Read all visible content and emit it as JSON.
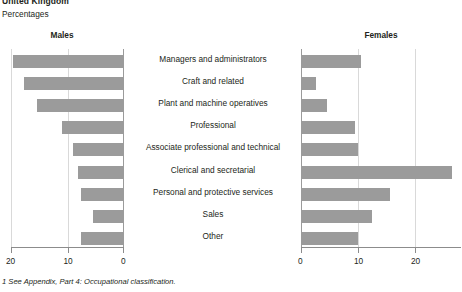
{
  "header": {
    "region_title": "United Kingdom",
    "subtitle": "Percentages"
  },
  "panels": {
    "males_heading": "Males",
    "females_heading": "Females"
  },
  "footnote": "1 See Appendix, Part 4: Occupational classification.",
  "colors": {
    "bar": "#9b9b9b",
    "axis": "#8c8c8c",
    "grid": "#d9d9d9",
    "text": "#231f20"
  },
  "chart_data": {
    "type": "bar",
    "title": "United Kingdom",
    "subtitle": "Percentages",
    "orientation": "horizontal",
    "layout": "butterfly-pyramid",
    "grid": true,
    "legend": "none",
    "xlabel": "",
    "ylabel": "",
    "categories": [
      "Managers and administrators",
      "Craft and related",
      "Plant and machine operatives",
      "Professional",
      "Associate professional and technical",
      "Clerical and secretarial",
      "Personal and protective services",
      "Sales",
      "Other"
    ],
    "series": [
      {
        "name": "Males",
        "side": "left",
        "axis_direction": "reversed",
        "xlim": [
          0,
          20
        ],
        "ticks": [
          20,
          10,
          0
        ],
        "tick_labels": [
          "20",
          "10",
          "0"
        ],
        "values": [
          19.6,
          17.7,
          15.4,
          11.0,
          9.0,
          8.2,
          7.6,
          5.5,
          7.6
        ]
      },
      {
        "name": "Females",
        "side": "right",
        "axis_direction": "normal",
        "xlim": [
          0,
          28
        ],
        "ticks": [
          0,
          10,
          20
        ],
        "tick_labels": [
          "0",
          "10",
          "20"
        ],
        "values": [
          10.5,
          2.6,
          4.5,
          9.5,
          10.0,
          26.5,
          15.5,
          12.5,
          10.0
        ]
      }
    ]
  }
}
